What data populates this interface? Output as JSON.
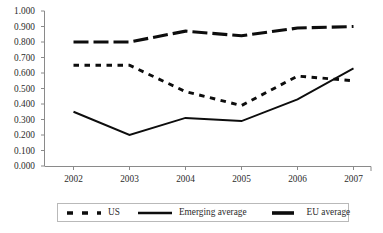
{
  "chart_data": {
    "type": "line",
    "title": "",
    "subtitle": "",
    "xlabel": "",
    "ylabel": "",
    "categories": [
      "2002",
      "2003",
      "2004",
      "2005",
      "2006",
      "2007"
    ],
    "x": [
      2002,
      2003,
      2004,
      2005,
      2006,
      2007
    ],
    "xlim": [
      2002,
      2007
    ],
    "ylim": [
      0.0,
      1.0
    ],
    "ytick_step": 0.1,
    "grid": false,
    "legend_position": "bottom",
    "series": [
      {
        "name": "US",
        "style": "dotted",
        "color": "#0d0d0d",
        "values": [
          0.65,
          0.65,
          0.48,
          0.39,
          0.58,
          0.55
        ]
      },
      {
        "name": "Emerging average",
        "style": "solid",
        "color": "#0d0d0d",
        "values": [
          0.35,
          0.2,
          0.31,
          0.29,
          0.43,
          0.63
        ]
      },
      {
        "name": "EU average",
        "style": "dashed-thick",
        "color": "#0d0d0d",
        "values": [
          0.8,
          0.8,
          0.87,
          0.84,
          0.89,
          0.9
        ]
      }
    ],
    "ytick_labels": [
      "0.000",
      "0.100",
      "0.200",
      "0.300",
      "0.400",
      "0.500",
      "0.600",
      "0.700",
      "0.800",
      "0.900",
      "1.000"
    ],
    "ytick_values": [
      0.0,
      0.1,
      0.2,
      0.3,
      0.4,
      0.5,
      0.6,
      0.7,
      0.8,
      0.9,
      1.0
    ],
    "xtick_labels": [
      "2002",
      "2003",
      "2004",
      "2005",
      "2006",
      "2007"
    ]
  },
  "legend": {
    "items": [
      {
        "label": "US",
        "style": "dotted"
      },
      {
        "label": "Emerging average",
        "style": "solid"
      },
      {
        "label": "EU average",
        "style": "dashed-thick"
      }
    ]
  },
  "colors": {
    "ink": "#0d0d0d",
    "axis": "#8a8a8a",
    "text": "#2b2b2b",
    "legend_border": "#b9b9b9",
    "background": "#ffffff"
  }
}
